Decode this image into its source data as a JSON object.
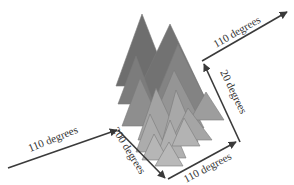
{
  "diagram": {
    "type": "3d-triangle-stack-with-direction-arrows",
    "colors": {
      "background": "#ffffff",
      "arrow": "#3a3a3a",
      "label": "#333333",
      "tri_dark": "#6e6e6e",
      "tri_mid": "#8c8c8c",
      "tri_light": "#a9a9a9",
      "tri_lighter": "#b9b9b9"
    },
    "arrows": [
      {
        "id": "arrow-left-incoming",
        "label": "110 degrees",
        "from": [
          8,
          170
        ],
        "to": [
          118,
          130
        ]
      },
      {
        "id": "arrow-down-200",
        "label": "200 degrees",
        "from": [
          118,
          130
        ],
        "to": [
          168,
          180
        ]
      },
      {
        "id": "arrow-bottom-right",
        "label": "110 degrees",
        "from": [
          168,
          180
        ],
        "to": [
          240,
          142
        ]
      },
      {
        "id": "arrow-up-20",
        "label": "20 degrees",
        "from": [
          240,
          142
        ],
        "to": [
          202,
          62
        ]
      },
      {
        "id": "arrow-top-right",
        "label": "110 degrees",
        "from": [
          202,
          62
        ],
        "to": [
          289,
          13
        ]
      }
    ],
    "labels": {
      "left": "110 degrees",
      "down": "200 degrees",
      "bottom": "110 degrees",
      "up": "20 degrees",
      "top": "110 degrees"
    }
  }
}
